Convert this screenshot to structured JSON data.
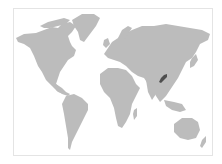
{
  "map": {
    "type": "world-locator-map",
    "projection": "equirectangular-like",
    "colors": {
      "background": "#ffffff",
      "frame": "#e4e4e4",
      "land": "#bcbcbc",
      "highlight": "#4e4e4e"
    },
    "highlighted_region": {
      "label": "region in southern China",
      "approx_pixel_center": [
        163,
        78
      ]
    }
  }
}
